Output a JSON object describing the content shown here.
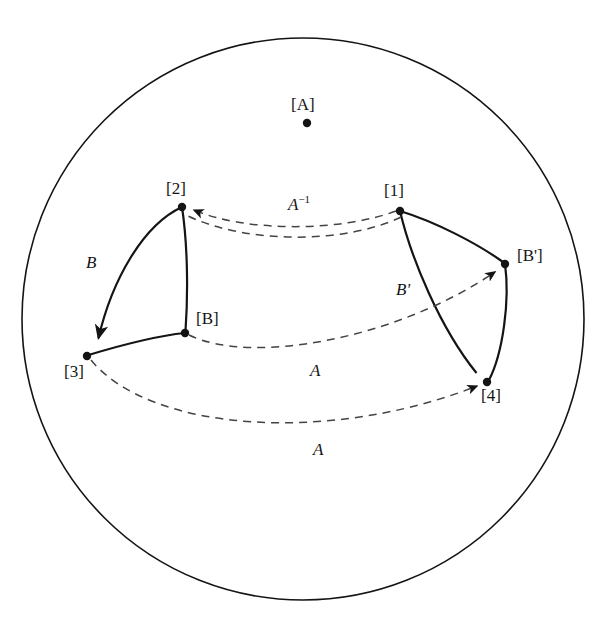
{
  "figure": {
    "background_color": "#ffffff",
    "stroke_color": "#141414"
  },
  "boundary": {
    "name": "poincare-disk-boundary",
    "center_x": 303,
    "center_y": 319,
    "radius": 281,
    "stroke_width": 1.6
  },
  "nodes": [
    {
      "id": "A",
      "label": "[A]",
      "x": 307,
      "y": 123,
      "label_x": 307,
      "label_y": 104,
      "label_anchor": "middle"
    },
    {
      "id": "2",
      "label": "[2]",
      "x": 182,
      "y": 207,
      "label_x": 182,
      "label_y": 188,
      "label_anchor": "middle"
    },
    {
      "id": "1",
      "label": "[1]",
      "x": 400,
      "y": 211,
      "label_x": 399,
      "label_y": 190,
      "label_anchor": "middle"
    },
    {
      "id": "B",
      "label": "[B]",
      "x": 185,
      "y": 333,
      "label_x": 199,
      "label_y": 320,
      "label_anchor": "start"
    },
    {
      "id": "3",
      "label": "[3]",
      "x": 87,
      "y": 356,
      "label_x": 80,
      "label_y": 374,
      "label_anchor": "middle"
    },
    {
      "id": "Bp",
      "label": "[B']",
      "x": 505,
      "y": 264,
      "label_x": 519,
      "label_y": 258,
      "label_anchor": "start"
    },
    {
      "id": "4",
      "label": "[4]",
      "x": 487,
      "y": 382,
      "label_x": 491,
      "label_y": 400,
      "label_anchor": "start"
    }
  ],
  "solid_edges": [
    {
      "name": "edge-2-to-3",
      "from": "2",
      "to": "3",
      "label": "B",
      "label_x": 93,
      "label_y": 265,
      "arrow": "end"
    },
    {
      "name": "edge-2-to-B",
      "from": "2",
      "to": "B",
      "label": "",
      "arrow": "none"
    },
    {
      "name": "edge-B-to-3",
      "from": "B",
      "to": "3",
      "label": "",
      "arrow": "none"
    },
    {
      "name": "edge-1-to-4",
      "from": "1",
      "to": "4",
      "label": "B'",
      "label_x": 404,
      "label_y": 293,
      "arrow": "end"
    },
    {
      "name": "edge-1-to-Bp",
      "from": "1",
      "to": "Bp",
      "label": "",
      "arrow": "none"
    },
    {
      "name": "edge-Bp-to-4",
      "from": "Bp",
      "to": "4",
      "label": "",
      "arrow": "none"
    }
  ],
  "dashed_edges": [
    {
      "name": "arc-1-to-2-upper",
      "from": "1",
      "to": "2",
      "label": "A^-1",
      "label_base": "A",
      "label_sup": "-1",
      "label_x": 303,
      "label_y": 206,
      "arrow": "end"
    },
    {
      "name": "arc-1-to-2-lower",
      "from": "1",
      "to": "2",
      "label": "",
      "arrow": "none"
    },
    {
      "name": "arc-B-to-Bp",
      "from": "B",
      "to": "Bp",
      "label": "A",
      "label_base": "A",
      "label_sup": "",
      "label_x": 316,
      "label_y": 374,
      "arrow": "end"
    },
    {
      "name": "arc-3-to-4",
      "from": "3",
      "to": "4",
      "label": "A",
      "label_base": "A",
      "label_sup": "",
      "label_x": 319,
      "label_y": 454,
      "arrow": "end"
    }
  ],
  "labels": {
    "A_point": "[A]",
    "node_1": "[1]",
    "node_2": "[2]",
    "node_3": "[3]",
    "node_4": "[4]",
    "node_B": "[B]",
    "node_Bprime": "[B']",
    "edge_B": "B",
    "edge_Bprime": "B'",
    "map_A": "A",
    "map_A_inverse_base": "A",
    "map_A_inverse_sup": "−1"
  }
}
